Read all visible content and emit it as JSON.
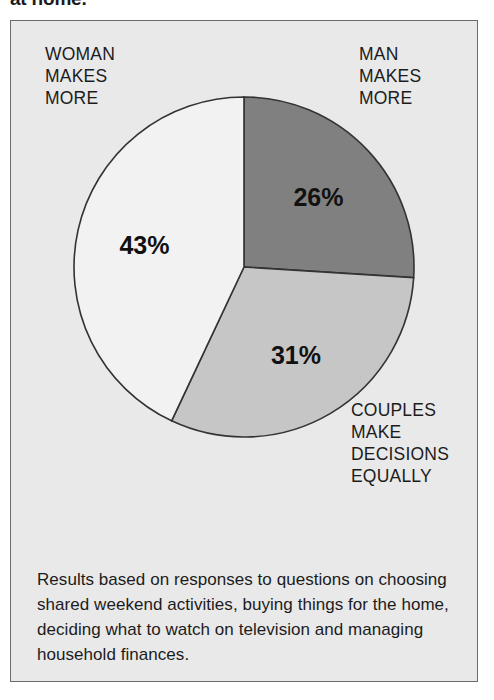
{
  "headline": "at home.",
  "labels": {
    "woman": "WOMAN\nMAKES\nMORE",
    "woman_lines": [
      "WOMAN",
      "MAKES",
      "MORE"
    ],
    "man_lines": [
      "MAN",
      "MAKES",
      "MORE"
    ],
    "couples_lines": [
      "COUPLES",
      "MAKE",
      "DECISIONS",
      "EQUALLY"
    ]
  },
  "footnote": "Results based on responses to questions on choosing shared weekend activities, buying things for the home, deciding what to watch on television and managing household finances.",
  "colors": {
    "panel_background": "#e9e9e9",
    "panel_border": "#6b6b6b",
    "slice_man": "#808080",
    "slice_couples": "#c6c6c6",
    "slice_woman": "#f2f2f2",
    "slice_outline": "#333333",
    "text": "#1c1c1c"
  },
  "chart_data": {
    "type": "pie",
    "title": "at home.",
    "xlabel": "",
    "ylabel": "",
    "units": "percent",
    "start_angle_deg": 0,
    "direction": "clockwise",
    "categories": [
      "MAN MAKES MORE",
      "COUPLES MAKE DECISIONS EQUALLY",
      "WOMAN MAKES MORE"
    ],
    "values": [
      26,
      31,
      43
    ],
    "labels": [
      "26%",
      "31%",
      "43%"
    ],
    "colors": [
      "#808080",
      "#c6c6c6",
      "#f2f2f2"
    ],
    "legend_position": "callouts-around-pie",
    "grid": false,
    "annotations": [
      "Results based on responses to questions on choosing shared weekend activities, buying things for the home, deciding what to watch on television and managing household finances."
    ],
    "slices": [
      {
        "name": "MAN MAKES MORE",
        "value": 26,
        "label": "26%",
        "color": "#808080",
        "start_deg": 0,
        "end_deg": 93.6,
        "callout": "MAN\nMAKES\nMORE"
      },
      {
        "name": "COUPLES MAKE DECISIONS EQUALLY",
        "value": 31,
        "label": "31%",
        "color": "#c6c6c6",
        "start_deg": 93.6,
        "end_deg": 205.2,
        "callout": "COUPLES\nMAKE\nDECISIONS\nEQUALLY"
      },
      {
        "name": "WOMAN MAKES MORE",
        "value": 43,
        "label": "43%",
        "color": "#f2f2f2",
        "start_deg": 205.2,
        "end_deg": 360,
        "callout": "WOMAN\nMAKES\nMORE"
      }
    ]
  }
}
